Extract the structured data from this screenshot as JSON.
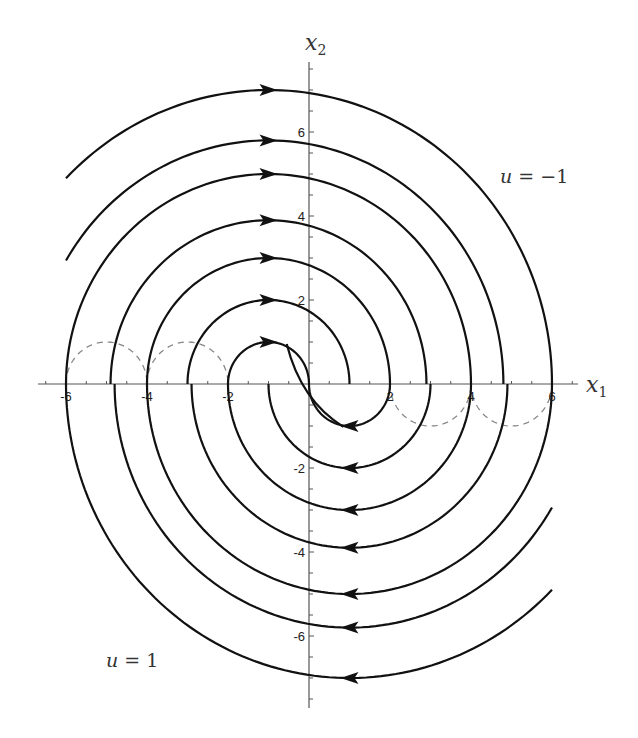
{
  "figure": {
    "type": "phase-portrait",
    "x_axis": {
      "label": "x",
      "subscript": "1",
      "ticks": [
        -6,
        -4,
        -2,
        2,
        4,
        6
      ],
      "tick_labels": [
        "-6",
        "-4",
        "-2",
        "2",
        "4",
        "6"
      ],
      "range": [
        -6.5,
        6.5
      ]
    },
    "y_axis": {
      "label": "x",
      "subscript": "2",
      "ticks": [
        -6,
        -4,
        -2,
        2,
        4,
        6
      ],
      "tick_labels": [
        "-6",
        "-4",
        "-2",
        "2",
        "4",
        "6"
      ],
      "range": [
        -7.8,
        7.7
      ]
    },
    "region_labels": {
      "upper_right": {
        "text_var": "u",
        "text_rest": " = −1"
      },
      "lower_left": {
        "text_var": "u",
        "text_rest": " = 1"
      }
    },
    "upper_arcs": {
      "control": -1,
      "center": [
        -1,
        0
      ],
      "radii": [
        1,
        2,
        3,
        3.9,
        5,
        5.8,
        7
      ],
      "arrow_direction": "right"
    },
    "lower_arcs": {
      "control": 1,
      "center": [
        1,
        0
      ],
      "radii": [
        1,
        2,
        3,
        3.9,
        5,
        5.8,
        7
      ],
      "arrow_direction": "left"
    },
    "switching_curves": {
      "style": "dashed",
      "upper_semicircles_centers": [
        -5,
        -3
      ],
      "lower_semicircles_centers": [
        3,
        5
      ],
      "radius": 1
    },
    "colors": {
      "trajectory": "#111111",
      "axis": "#555555",
      "switching_curve": "#888888"
    }
  }
}
